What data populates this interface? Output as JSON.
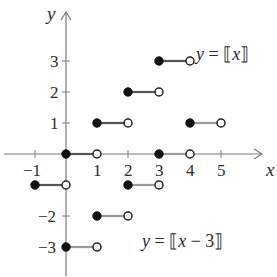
{
  "chart_data": {
    "type": "line",
    "title": "",
    "xlabel": "x",
    "ylabel": "y",
    "xlim": [
      -1.5,
      6
    ],
    "ylim": [
      -3.8,
      4
    ],
    "grid": false,
    "x_ticks": [
      -1,
      1,
      2,
      3,
      4,
      5
    ],
    "x_tick_labels": [
      "-1",
      "1",
      "2",
      "3",
      "4",
      "5"
    ],
    "y_ticks": [
      3,
      2,
      1,
      -2,
      -3
    ],
    "y_tick_labels": [
      "3",
      "2",
      "1",
      "−2",
      "−3"
    ],
    "series": [
      {
        "name": "y = [[x]]",
        "style": "dark",
        "steps": [
          {
            "x0": -1,
            "x1": 0,
            "y": -1
          },
          {
            "x0": 0,
            "x1": 1,
            "y": 0
          },
          {
            "x0": 1,
            "x1": 2,
            "y": 1
          },
          {
            "x0": 2,
            "x1": 3,
            "y": 2
          },
          {
            "x0": 3,
            "x1": 4,
            "y": 3
          }
        ]
      },
      {
        "name": "y = [[x − 3]]",
        "style": "gray",
        "steps": [
          {
            "x0": 0,
            "x1": 1,
            "y": -3
          },
          {
            "x0": 1,
            "x1": 2,
            "y": -2
          },
          {
            "x0": 2,
            "x1": 3,
            "y": -1
          },
          {
            "x0": 3,
            "x1": 4,
            "y": 0
          },
          {
            "x0": 4,
            "x1": 5,
            "y": 1
          }
        ]
      }
    ],
    "annotations": [
      {
        "text": "y = [[x]]",
        "near": [
          4.2,
          3
        ]
      },
      {
        "text": "y = [[x − 3]]",
        "near": [
          2.7,
          -2.8
        ]
      }
    ]
  },
  "labels": {
    "x_axis": "x",
    "y_axis": "y",
    "eq_top_y": "y",
    "eq_top_rest": " = ⟦",
    "eq_top_x": "x",
    "eq_top_close": "⟧",
    "eq_bottom_y": "y",
    "eq_bottom_rest": " = ⟦",
    "eq_bottom_x": "x",
    "eq_bottom_tail": " − 3⟧"
  }
}
